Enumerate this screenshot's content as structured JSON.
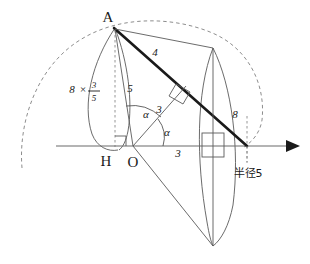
{
  "diagram": {
    "points": {
      "A": "A",
      "H": "H",
      "O": "O"
    },
    "labels": {
      "segment_AB_upper": "4",
      "segment_AB_lower": "8",
      "segment_AO": "5",
      "segment_OP": "3",
      "segment_OX": "3",
      "angle_upper": "α",
      "angle_lower": "α",
      "height_expr_factor": "8",
      "height_expr_times": "×",
      "height_expr_numerator": "3",
      "height_expr_denominator": "5",
      "radius_note": "半径5"
    },
    "colors": {
      "background": "#ffffff",
      "thin_stroke": "#5a5a5a",
      "thick_stroke": "#1a1a1a",
      "dashed_stroke": "#808080",
      "axis_stroke": "#6b6b6b",
      "text": "#1a1a1a"
    }
  }
}
